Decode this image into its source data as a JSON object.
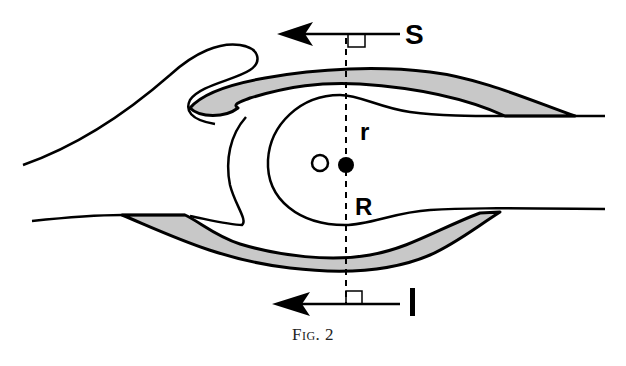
{
  "figure": {
    "caption": "Fig. 2",
    "labels": {
      "top_arrow": "S",
      "bottom_arrow": "I",
      "small_radius": "r",
      "large_radius": "R",
      "open_point": "O"
    },
    "colors": {
      "stroke": "#000000",
      "shaded_band": "#c8c8c8",
      "background": "#ffffff"
    },
    "elements": [
      "top arrow pointing left labelled S with right-angle marker",
      "bottom arrow pointing left labelled I with right-angle marker",
      "vertical dashed line through center",
      "open circle O and filled center point",
      "upper shaded crescent band",
      "lower shaded crescent band",
      "inner closed lobe contour",
      "outer curling wave contour on the left",
      "horizontal tail lines extending right"
    ]
  }
}
